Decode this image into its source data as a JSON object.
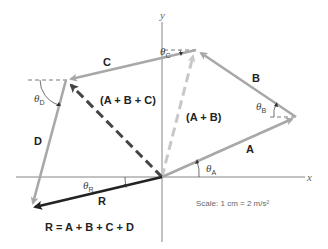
{
  "diagram": {
    "axes": {
      "x_label": "x",
      "y_label": "y"
    },
    "vectors": [
      {
        "name": "A",
        "label": "A",
        "angle_label": "θ",
        "angle_sub": "A",
        "color": "#a8a8a8"
      },
      {
        "name": "B",
        "label": "B",
        "angle_label": "θ",
        "angle_sub": "B",
        "color": "#a8a8a8"
      },
      {
        "name": "C",
        "label": "C",
        "angle_label": "θ",
        "angle_sub": "C",
        "color": "#a8a8a8"
      },
      {
        "name": "D",
        "label": "D",
        "angle_label": "θ",
        "angle_sub": "D",
        "color": "#a8a8a8"
      },
      {
        "name": "R",
        "label": "R",
        "angle_label": "θ",
        "angle_sub": "R",
        "color": "#222222"
      }
    ],
    "partial_sums": [
      {
        "name": "A+B",
        "label": "(A + B)",
        "color": "#c8c8c8",
        "style": "dashed"
      },
      {
        "name": "A+B+C",
        "label": "(A + B + C)",
        "color": "#444444",
        "style": "dashed"
      }
    ],
    "equation": "R = A + B + C + D",
    "scale_text": "Scale: 1 cm = 2 m/s²"
  }
}
